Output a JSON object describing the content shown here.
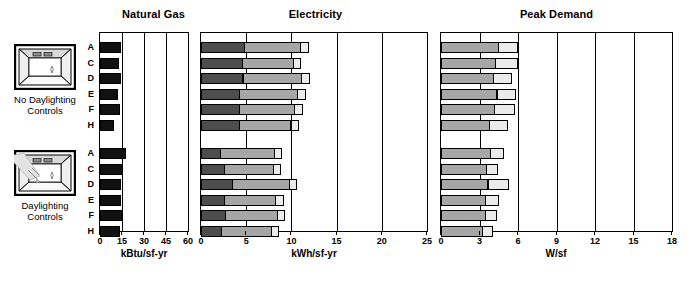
{
  "groups": [
    {
      "id": "no-daylighting",
      "caption": "No Daylighting\nControls",
      "icon": "room-no-daylighting-icon",
      "rows": [
        "A",
        "C",
        "D",
        "E",
        "F",
        "H"
      ]
    },
    {
      "id": "daylighting",
      "caption": "Daylighting\nControls",
      "icon": "room-daylighting-icon",
      "rows": [
        "A",
        "C",
        "D",
        "E",
        "F",
        "H"
      ]
    }
  ],
  "colors": {
    "heating": "#111111",
    "lighting": "#4d4d4d",
    "cooling": "#a6a6a6",
    "other": "#ebebeb",
    "axis": "#000000"
  },
  "legends": [
    {
      "id": "natural-gas-legend",
      "items": [
        {
          "label": "Heating",
          "color": "#111111"
        }
      ]
    },
    {
      "id": "electricity-legend",
      "items": [
        {
          "label": "Lighting",
          "color": "#4d4d4d"
        },
        {
          "label": "Cooling",
          "color": "#a6a6a6"
        },
        {
          "label": "Other",
          "color": "#ebebeb"
        }
      ]
    },
    {
      "id": "peak-demand-legend",
      "items": [
        {
          "label": "Cooling",
          "color": "#a6a6a6"
        },
        {
          "label": "Other",
          "color": "#ebebeb"
        }
      ]
    }
  ],
  "chart_data": [
    {
      "type": "bar",
      "id": "natural-gas",
      "title": "Natural Gas",
      "xlabel": "kBtu/sf-yr",
      "ylabel": "",
      "xlim": [
        0,
        60
      ],
      "ticks": [
        0,
        15,
        30,
        45,
        60
      ],
      "grid": true,
      "orientation": "horizontal",
      "stacked": true,
      "legend_position": "bottom",
      "categories": [
        "A",
        "C",
        "D",
        "E",
        "F",
        "H"
      ],
      "series": [
        {
          "name": "Heating",
          "color": "#111111",
          "values_no_daylighting": [
            14.6,
            13.2,
            14.2,
            12.6,
            13.4,
            9.6
          ],
          "values_daylighting": [
            18.0,
            15.4,
            14.4,
            14.2,
            15.2,
            13.6
          ]
        }
      ]
    },
    {
      "type": "bar",
      "id": "electricity",
      "title": "Electricity",
      "xlabel": "kWh/sf-yr",
      "ylabel": "",
      "xlim": [
        0,
        25
      ],
      "ticks": [
        0,
        5,
        10,
        15,
        20,
        25
      ],
      "grid": true,
      "orientation": "horizontal",
      "stacked": true,
      "legend_position": "bottom",
      "categories": [
        "A",
        "C",
        "D",
        "E",
        "F",
        "H"
      ],
      "series": [
        {
          "name": "Lighting",
          "color": "#4d4d4d",
          "values_no_daylighting": [
            4.9,
            4.6,
            4.7,
            4.3,
            4.3,
            4.3
          ],
          "values_daylighting": [
            2.2,
            2.6,
            3.5,
            2.6,
            2.8,
            2.3
          ]
        },
        {
          "name": "Cooling",
          "color": "#a6a6a6",
          "values_no_daylighting": [
            6.3,
            5.8,
            6.6,
            6.5,
            6.2,
            5.8
          ],
          "values_daylighting": [
            6.1,
            5.6,
            6.4,
            5.8,
            5.8,
            5.6
          ]
        },
        {
          "name": "Other",
          "color": "#ebebeb",
          "values_no_daylighting": [
            0.9,
            0.9,
            1.0,
            1.0,
            1.0,
            0.9
          ],
          "values_daylighting": [
            0.9,
            0.9,
            0.9,
            1.0,
            0.9,
            0.9
          ]
        }
      ]
    },
    {
      "type": "bar",
      "id": "peak-demand",
      "title": "Peak Demand",
      "xlabel": "W/sf",
      "ylabel": "",
      "xlim": [
        0,
        18
      ],
      "ticks": [
        0,
        3,
        6,
        9,
        12,
        15,
        18
      ],
      "grid": true,
      "orientation": "horizontal",
      "stacked": true,
      "legend_position": "bottom",
      "categories": [
        "A",
        "C",
        "D",
        "E",
        "F",
        "H"
      ],
      "series": [
        {
          "name": "Cooling",
          "color": "#a6a6a6",
          "values_no_daylighting": [
            4.5,
            4.3,
            4.1,
            4.4,
            4.2,
            3.8
          ],
          "values_daylighting": [
            3.9,
            3.6,
            3.7,
            3.5,
            3.5,
            3.3
          ]
        },
        {
          "name": "Other",
          "color": "#ebebeb",
          "values_no_daylighting": [
            1.6,
            1.8,
            1.5,
            1.5,
            1.6,
            1.5
          ],
          "values_daylighting": [
            1.1,
            0.9,
            1.7,
            1.1,
            0.9,
            0.8
          ]
        }
      ]
    }
  ]
}
